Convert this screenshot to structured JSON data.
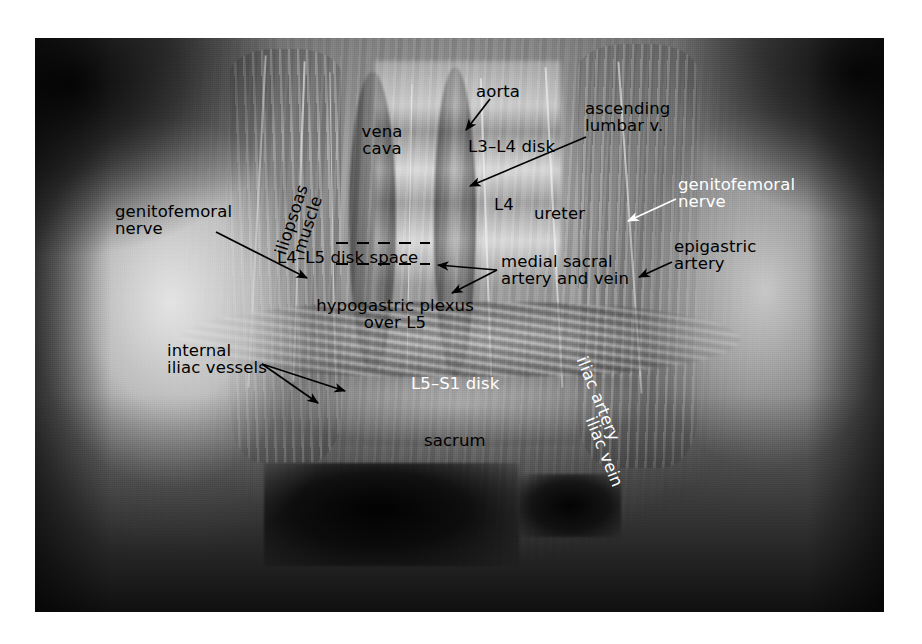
{
  "figure": {
    "kind": "anatomical-photograph",
    "border_color": "#ffffff",
    "photo_bounds": {
      "x": 35,
      "y": 38,
      "width": 849,
      "height": 574
    }
  },
  "colors": {
    "label_black": "#000000",
    "label_white": "#ffffff",
    "page_background": "#ffffff",
    "photo_background": "#121212"
  },
  "labels": [
    {
      "id": "aorta",
      "text": "aorta",
      "color": "#000000",
      "x": 476,
      "y": 83,
      "align": "left",
      "has_arrow": true,
      "rotation": 0
    },
    {
      "id": "vena-cava",
      "text": "vena\ncava",
      "color": "#000000",
      "x": 382,
      "y": 123,
      "align": "center",
      "has_arrow": false,
      "rotation": 0
    },
    {
      "id": "l3-l4-disk",
      "text": "L3–L4 disk",
      "color": "#000000",
      "x": 468,
      "y": 138,
      "align": "left",
      "has_arrow": false,
      "rotation": 0
    },
    {
      "id": "ascending-lumbar-vein",
      "text": "ascending\nlumbar v.",
      "color": "#000000",
      "x": 585,
      "y": 100,
      "align": "left",
      "has_arrow": true,
      "rotation": 0
    },
    {
      "id": "l4",
      "text": "L4",
      "color": "#000000",
      "x": 494,
      "y": 196,
      "align": "left",
      "has_arrow": false,
      "rotation": 0
    },
    {
      "id": "ureter",
      "text": "ureter",
      "color": "#000000",
      "x": 534,
      "y": 205,
      "align": "left",
      "has_arrow": false,
      "rotation": 0
    },
    {
      "id": "genitofemoral-nerve-right",
      "text": "genitofemoral\nnerve",
      "color": "#ffffff",
      "x": 678,
      "y": 176,
      "align": "left",
      "has_arrow": true,
      "rotation": 0
    },
    {
      "id": "genitofemoral-nerve-left",
      "text": "genitofemoral\nnerve",
      "color": "#000000",
      "x": 115,
      "y": 203,
      "align": "left",
      "has_arrow": true,
      "rotation": 0
    },
    {
      "id": "iliopsoas-muscle",
      "text": "iliopsoas\nmuscle",
      "color": "#000000",
      "x": 300,
      "y": 205,
      "align": "center",
      "has_arrow": false,
      "rotation": -72
    },
    {
      "id": "l4-l5-disk-space",
      "text": "L4–L5 disk space",
      "color": "#000000",
      "x": 277,
      "y": 249,
      "align": "left",
      "has_arrow": false,
      "rotation": 0
    },
    {
      "id": "medial-sacral-artery-vein",
      "text": "medial sacral\nartery and vein",
      "color": "#000000",
      "x": 501,
      "y": 253,
      "align": "left",
      "has_arrow": true,
      "rotation": 0
    },
    {
      "id": "epigastric-artery",
      "text": "epigastric\nartery",
      "color": "#000000",
      "x": 674,
      "y": 238,
      "align": "left",
      "has_arrow": true,
      "rotation": 0
    },
    {
      "id": "hypogastric-plexus-over-l5",
      "text": "hypogastric plexus\nover L5",
      "color": "#000000",
      "x": 395,
      "y": 297,
      "align": "center",
      "has_arrow": false,
      "rotation": 0
    },
    {
      "id": "internal-iliac-vessels",
      "text": "internal\niliac vessels",
      "color": "#000000",
      "x": 167,
      "y": 342,
      "align": "left",
      "has_arrow": true,
      "rotation": 0
    },
    {
      "id": "l5-s1-disk",
      "text": "L5–S1 disk",
      "color": "#ffffff",
      "x": 411,
      "y": 375,
      "align": "left",
      "has_arrow": false,
      "rotation": 0
    },
    {
      "id": "iliac-artery",
      "text": "iliac artery",
      "color": "#ffffff",
      "x": 598,
      "y": 390,
      "align": "center",
      "has_arrow": false,
      "rotation": 68
    },
    {
      "id": "iliac-vein",
      "text": "iliac vein",
      "color": "#ffffff",
      "x": 604,
      "y": 443,
      "align": "center",
      "has_arrow": false,
      "rotation": 68
    },
    {
      "id": "sacrum",
      "text": "sacrum",
      "color": "#000000",
      "x": 424,
      "y": 432,
      "align": "left",
      "has_arrow": false,
      "rotation": 0
    }
  ],
  "leaders": [
    {
      "id": "leader-aorta",
      "from": [
        490,
        99
      ],
      "to": [
        466,
        130
      ],
      "color": "#000000"
    },
    {
      "id": "leader-ascending-lumbar-vein",
      "from": [
        586,
        137
      ],
      "to": [
        470,
        186
      ],
      "color": "#000000"
    },
    {
      "id": "leader-genitofemoral-right",
      "from": [
        676,
        199
      ],
      "to": [
        628,
        221
      ],
      "color": "#ffffff"
    },
    {
      "id": "leader-genitofemoral-left",
      "from": [
        216,
        232
      ],
      "to": [
        307,
        278
      ],
      "color": "#000000"
    },
    {
      "id": "leader-epigastric-artery",
      "from": [
        672,
        262
      ],
      "to": [
        639,
        277
      ],
      "color": "#000000"
    },
    {
      "id": "leader-medial-sacral-1",
      "from": [
        497,
        270
      ],
      "to": [
        438,
        265
      ],
      "color": "#000000"
    },
    {
      "id": "leader-medial-sacral-2",
      "from": [
        497,
        270
      ],
      "to": [
        452,
        293
      ],
      "color": "#000000"
    },
    {
      "id": "leader-internal-iliac-1",
      "from": [
        262,
        364
      ],
      "to": [
        345,
        391
      ],
      "color": "#000000"
    },
    {
      "id": "leader-internal-iliac-2",
      "from": [
        262,
        364
      ],
      "to": [
        318,
        403
      ],
      "color": "#000000"
    }
  ],
  "dashed_markers": [
    {
      "id": "disk-space-line-upper",
      "x1": 336,
      "y1": 243,
      "x2": 430,
      "y2": 243,
      "color": "#000000"
    },
    {
      "id": "disk-space-line-lower",
      "x1": 336,
      "y1": 264,
      "x2": 430,
      "y2": 264,
      "color": "#000000"
    }
  ]
}
